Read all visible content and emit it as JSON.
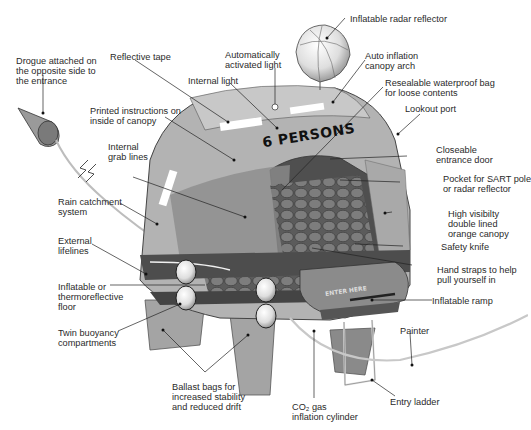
{
  "diagram": {
    "canopy_text": "6 PERSONS",
    "ramp_text": "ENTER HERE",
    "colors": {
      "canopy_light": "#b9b9b9",
      "canopy_mid": "#8f8f8f",
      "canopy_dark": "#5e5e5e",
      "floor": "#6a6a6a",
      "tube": "#4a4a4a",
      "reflective_tape": "#ffffff",
      "line": "#222222"
    },
    "labels": [
      {
        "id": "drogue",
        "text": "Drogue attached on\nthe opposite side to\nthe entrance"
      },
      {
        "id": "reflective-tape",
        "text": "Reflective tape"
      },
      {
        "id": "auto-light",
        "text": "Automatically\nactivated light"
      },
      {
        "id": "radar-reflector",
        "text": "Inflatable radar reflector"
      },
      {
        "id": "canopy-arch",
        "text": "Auto inflation\ncanopy arch"
      },
      {
        "id": "internal-light",
        "text": "Internal light"
      },
      {
        "id": "waterproof-bag",
        "text": "Resealable waterproof bag\nfor loose contents"
      },
      {
        "id": "printed-instructions",
        "text": "Printed instructions on\ninside of canopy"
      },
      {
        "id": "lookout-port",
        "text": "Lookout port"
      },
      {
        "id": "grab-lines",
        "text": "Internal\ngrab lines"
      },
      {
        "id": "entrance-door",
        "text": "Closeable\nentrance door"
      },
      {
        "id": "sart-pocket",
        "text": "Pocket for SART pole\nor radar reflector"
      },
      {
        "id": "rain-catchment",
        "text": "Rain catchment\nsystem"
      },
      {
        "id": "orange-canopy",
        "text": "High visibilty\ndouble lined\norange canopy"
      },
      {
        "id": "external-lifelines",
        "text": "External\nlifelines"
      },
      {
        "id": "safety-knife",
        "text": "Safety knife"
      },
      {
        "id": "hand-straps",
        "text": "Hand straps to help\npull yourself in"
      },
      {
        "id": "floor",
        "text": "Inflatable or\nthermoreflective\nfloor"
      },
      {
        "id": "inflatable-ramp",
        "text": "Inflatable ramp"
      },
      {
        "id": "buoyancy",
        "text": "Twin buoyancy\ncompartments"
      },
      {
        "id": "painter",
        "text": "Painter"
      },
      {
        "id": "ballast-bags",
        "text": "Ballast bags for\nincreased stability\nand reduced drift"
      },
      {
        "id": "entry-ladder",
        "text": "Entry ladder"
      },
      {
        "id": "co2-cylinder",
        "text": "CO₂ gas\ninflation cylinder"
      }
    ]
  }
}
